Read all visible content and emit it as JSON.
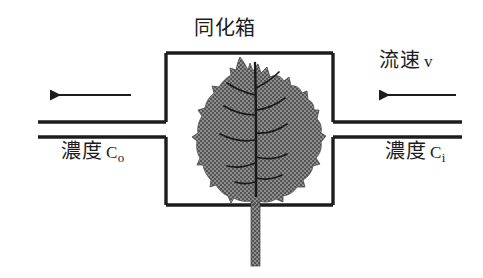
{
  "figure": {
    "type": "schematic-diagram",
    "title": "同化箱",
    "labels": {
      "chamber_title": "同化箱",
      "flow_velocity": "流速",
      "flow_velocity_symbol": "v",
      "concentration_out_word": "濃度",
      "concentration_out_symbol": "C",
      "concentration_out_subscript": "o",
      "concentration_in_word": "濃度",
      "concentration_in_symbol": "C",
      "concentration_in_subscript": "i"
    },
    "elements": {
      "chamber_box": "assimilation-chamber-rectangle",
      "inlet_pipe": "right-side-duct",
      "outlet_pipe": "left-side-duct",
      "inlet_arrow": "air-inflow-arrow-pointing-left",
      "outlet_arrow": "air-outflow-arrow-pointing-left",
      "leaf": "shaded-leaf-specimen",
      "petiole": "leaf-stem-exiting-chamber-bottom"
    },
    "colors": {
      "line": "#1d1d1d",
      "leaf_fill": "#808080",
      "leaf_fill_dark": "#555555",
      "leaf_vein": "#1a1a1a",
      "background": "#ffffff"
    },
    "geometry": {
      "box_left": 166,
      "box_right": 333,
      "box_top": 53,
      "box_bottom": 205,
      "pipe_top_y": 122,
      "pipe_bottom_y": 137,
      "arrow_y": 95,
      "left_pipe_start_x": 38,
      "right_pipe_end_x": 462,
      "stem_bottom_y": 266
    }
  }
}
